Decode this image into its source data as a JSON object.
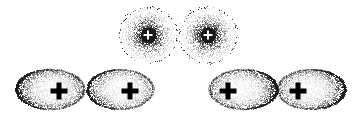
{
  "figure": {
    "title": "",
    "background_color": "#ffffff",
    "width": 356,
    "height": 123,
    "point_color": "#1a1a1a",
    "marker_color": "#000000",
    "core_marker_color": "#ffffff"
  },
  "chart_data": {
    "type": "scatter",
    "title": "",
    "xlabel": "",
    "ylabel": "",
    "xlim": [
      0,
      356
    ],
    "ylim": [
      0,
      123
    ],
    "grid": false,
    "legend": "none",
    "series": [
      {
        "name": "top-cloud-left",
        "shape": "round",
        "center": [
          148,
          35
        ],
        "radius_x": 28,
        "radius_y": 27,
        "n_points": 2600,
        "concentration": 3.0,
        "core_radius": 7,
        "peak_darkness": 0.95,
        "marker": {
          "label": "+",
          "type": "cross",
          "color": "#ffffff",
          "size": 9,
          "stroke": 2,
          "position": [
            148,
            35
          ]
        }
      },
      {
        "name": "top-cloud-right",
        "shape": "round",
        "center": [
          208,
          35
        ],
        "radius_x": 28,
        "radius_y": 27,
        "n_points": 2600,
        "concentration": 3.0,
        "core_radius": 7,
        "peak_darkness": 0.95,
        "marker": {
          "label": "+",
          "type": "cross",
          "color": "#ffffff",
          "size": 9,
          "stroke": 2,
          "position": [
            208,
            35
          ]
        }
      },
      {
        "name": "bottom-ellipse-1",
        "shape": "ellipse",
        "center": [
          50,
          89
        ],
        "radius_x": 34,
        "radius_y": 20,
        "n_points": 2300,
        "concentration": 1.0,
        "rim_darkness": 0.55,
        "shade_side": "left",
        "marker": {
          "label": "+",
          "type": "cross",
          "color": "#000000",
          "size": 17,
          "stroke": 5,
          "position": [
            59,
            91
          ]
        }
      },
      {
        "name": "bottom-ellipse-2",
        "shape": "ellipse",
        "center": [
          120,
          89
        ],
        "radius_x": 33,
        "radius_y": 20,
        "n_points": 2000,
        "concentration": 1.0,
        "rim_darkness": 0.42,
        "shade_side": "left",
        "marker": {
          "label": "+",
          "type": "cross",
          "color": "#000000",
          "size": 17,
          "stroke": 5,
          "position": [
            130,
            91
          ]
        }
      },
      {
        "name": "bottom-ellipse-3",
        "shape": "ellipse",
        "center": [
          243,
          89
        ],
        "radius_x": 34,
        "radius_y": 20,
        "n_points": 2200,
        "concentration": 1.0,
        "rim_darkness": 0.5,
        "shade_side": "right",
        "marker": {
          "label": "+",
          "type": "cross",
          "color": "#000000",
          "size": 17,
          "stroke": 5,
          "position": [
            228,
            91
          ]
        }
      },
      {
        "name": "bottom-ellipse-4",
        "shape": "ellipse",
        "center": [
          311,
          89
        ],
        "radius_x": 34,
        "radius_y": 20,
        "n_points": 2200,
        "concentration": 1.0,
        "rim_darkness": 0.5,
        "shade_side": "right",
        "marker": {
          "label": "+",
          "type": "cross",
          "color": "#000000",
          "size": 17,
          "stroke": 5,
          "position": [
            298,
            91
          ]
        }
      }
    ]
  }
}
